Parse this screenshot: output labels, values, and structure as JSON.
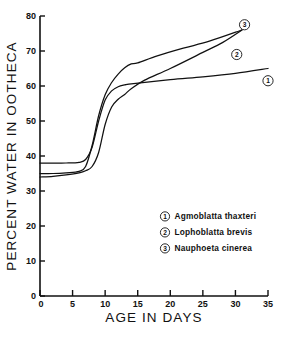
{
  "chart_data": {
    "type": "line",
    "title": "",
    "xlabel": "AGE  IN  DAYS",
    "ylabel": "PERCENT WATER IN OOTHECA",
    "xlim": [
      0,
      35
    ],
    "ylim": [
      0,
      80
    ],
    "xticks": [
      0,
      5,
      10,
      15,
      20,
      25,
      30,
      35
    ],
    "yticks": [
      0,
      10,
      20,
      30,
      40,
      50,
      60,
      70,
      80
    ],
    "grid": false,
    "legend_position": "center-right-lower",
    "series": [
      {
        "key": "1",
        "marker_label": "1",
        "name": "Agmoblatta thaxteri",
        "x": [
          0,
          2,
          4,
          6,
          7,
          8,
          9,
          10,
          11,
          12,
          13,
          14,
          20,
          25,
          30,
          35
        ],
        "y": [
          38.0,
          38.0,
          38.0,
          38.2,
          39.0,
          42.5,
          50.0,
          56.0,
          58.6,
          59.8,
          60.3,
          60.6,
          61.8,
          62.6,
          63.6,
          65.0
        ]
      },
      {
        "key": "2",
        "marker_label": "2",
        "name": "Lophoblatta brevis",
        "x": [
          0,
          2,
          4,
          6,
          7,
          8,
          9,
          10,
          11,
          12,
          13,
          14,
          16,
          20,
          25,
          28,
          31
        ],
        "y": [
          34.0,
          34.2,
          34.6,
          35.2,
          35.8,
          37.0,
          41.0,
          49.0,
          54.0,
          56.2,
          57.6,
          59.2,
          61.6,
          65.0,
          69.6,
          72.4,
          76.0
        ]
      },
      {
        "key": "3",
        "marker_label": "3",
        "name": "Nauphoeta cinerea",
        "x": [
          0,
          2,
          4,
          6,
          7,
          8,
          9,
          10,
          11,
          12,
          13,
          14,
          15,
          18,
          22,
          26,
          31
        ],
        "y": [
          35.0,
          35.0,
          35.2,
          35.6,
          37.0,
          43.0,
          51.5,
          57.5,
          61.0,
          63.4,
          65.2,
          66.3,
          66.6,
          68.6,
          70.8,
          72.8,
          76.0
        ]
      }
    ],
    "curve_end_markers": [
      {
        "label": "1",
        "x": 35.0,
        "y": 61.5
      },
      {
        "label": "2",
        "x": 30.2,
        "y": 69.0
      },
      {
        "label": "3",
        "x": 31.4,
        "y": 77.5
      }
    ],
    "legend": [
      {
        "marker": "1",
        "label": "Agmoblatta thaxteri"
      },
      {
        "marker": "2",
        "label": "Lophoblatta brevis"
      },
      {
        "marker": "3",
        "label": "Nauphoeta cinerea"
      }
    ]
  },
  "colors": {
    "ink": "#111111",
    "background": "#ffffff"
  }
}
